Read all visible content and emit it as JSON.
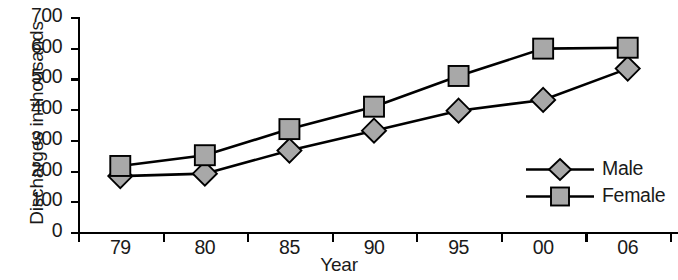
{
  "chart_data": {
    "type": "line",
    "title": "",
    "xlabel": "Year",
    "ylabel": "Discharges in thousands",
    "categories": [
      "79",
      "80",
      "85",
      "90",
      "95",
      "00",
      "06"
    ],
    "ylim": [
      0,
      700
    ],
    "yticks": [
      0,
      100,
      200,
      300,
      400,
      500,
      600,
      700
    ],
    "ytick_labels": [
      "0",
      "100",
      "200",
      "300",
      "400",
      "500",
      "600",
      "700"
    ],
    "grid": false,
    "legend_position": "right",
    "series": [
      {
        "name": "Male",
        "marker": "diamond",
        "marker_fill": "#a8a8a8",
        "marker_stroke": "#000000",
        "line_color": "#000000",
        "values": [
          182,
          190,
          265,
          330,
          395,
          430,
          532
        ]
      },
      {
        "name": "Female",
        "marker": "square",
        "marker_fill": "#a8a8a8",
        "marker_stroke": "#000000",
        "line_color": "#000000",
        "values": [
          215,
          250,
          335,
          408,
          508,
          597,
          600
        ]
      }
    ]
  },
  "axes": {
    "y_title": "Discharges in thousands",
    "x_title": "Year"
  },
  "legend": {
    "items": [
      {
        "label": "Male"
      },
      {
        "label": "Female"
      }
    ]
  },
  "colors": {
    "marker_fill": "#a8a8a8",
    "line": "#000000",
    "axis": "#000000",
    "background": "#ffffff"
  }
}
